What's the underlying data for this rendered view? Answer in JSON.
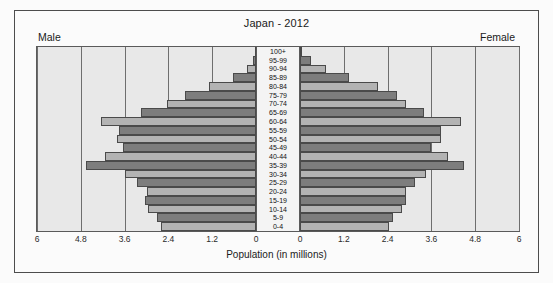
{
  "figure": {
    "title": "Japan - 2012",
    "left_side_label": "Male",
    "right_side_label": "Female",
    "xaxis_title": "Population (in millions)"
  },
  "chart_data": {
    "type": "bar",
    "subtype": "population-pyramid",
    "title": "Japan - 2012",
    "xlabel": "Population (in millions)",
    "ylabel": "",
    "xlim": [
      -6,
      6
    ],
    "xticks": [
      "6",
      "4.8",
      "3.6",
      "2.4",
      "1.2",
      "0",
      "0",
      "1.2",
      "2.4",
      "3.6",
      "4.8",
      "6"
    ],
    "xtick_values": [
      -6,
      -4.8,
      -3.6,
      -2.4,
      -1.2,
      0,
      0,
      1.2,
      2.4,
      3.6,
      4.8,
      6
    ],
    "grid": true,
    "legend": false,
    "orientation": "horizontal",
    "categories": [
      "100+",
      "95-99",
      "90-94",
      "85-89",
      "80-84",
      "75-79",
      "70-74",
      "65-69",
      "60-64",
      "55-59",
      "50-54",
      "45-49",
      "40-44",
      "35-39",
      "30-34",
      "25-29",
      "20-24",
      "15-19",
      "10-14",
      "5-9",
      "0-4"
    ],
    "series": [
      {
        "name": "Male",
        "side": "left",
        "color": "#7d7d7d",
        "values": [
          0.01,
          0.08,
          0.25,
          0.63,
          1.28,
          1.95,
          2.45,
          3.15,
          4.25,
          3.75,
          3.8,
          3.65,
          4.15,
          4.65,
          3.6,
          3.25,
          3.0,
          3.05,
          2.95,
          2.7,
          2.6
        ]
      },
      {
        "name": "Female",
        "side": "right",
        "color": "#b3b3b3",
        "values": [
          0.06,
          0.3,
          0.72,
          1.35,
          2.15,
          2.65,
          2.9,
          3.4,
          4.4,
          3.85,
          3.85,
          3.6,
          4.05,
          4.5,
          3.45,
          3.15,
          2.9,
          2.9,
          2.8,
          2.55,
          2.45
        ]
      }
    ],
    "bar_shade_alternation": [
      "dark",
      "light"
    ]
  },
  "colors": {
    "panel_background": "#e8e8e8",
    "page_background": "#fbfbfb",
    "bar_dark": "#7d7d7d",
    "bar_light": "#b3b3b3",
    "gridline": "#6e6e6e",
    "axis": "#5a5a5a",
    "text": "#1a1a1a"
  }
}
